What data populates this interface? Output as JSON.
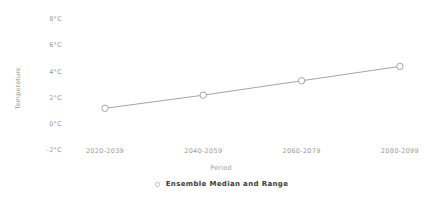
{
  "chart_data": {
    "type": "line",
    "title": "",
    "subtitle": "",
    "xlabel": "Period",
    "ylabel": "Temperature",
    "categories": [
      "2020-2039",
      "2040-2059",
      "2060-2079",
      "2080-2099"
    ],
    "series": [
      {
        "name": "Ensemble Median and Range",
        "values": [
          1.2,
          2.2,
          3.3,
          4.4
        ],
        "marker": "open-circle",
        "color": "#9a9a9a"
      }
    ],
    "y_tick_labels": [
      "8°C",
      "6°C",
      "4°C",
      "2°C",
      "0°C",
      "-2°C"
    ],
    "y_tick_values": [
      8,
      6,
      4,
      2,
      0,
      -2
    ],
    "ylim": [
      -2,
      8
    ],
    "grid": false,
    "legend_position": "bottom",
    "legend": [
      {
        "label": "Ensemble Median and Range",
        "marker": "open-circle"
      }
    ]
  },
  "colors": {
    "line": "#9a9a9a",
    "marker_stroke": "#9a9a9a",
    "marker_fill": "#ffffff",
    "tick_text": "#9a9a9a",
    "legend_text": "#3a3a3a",
    "background": "#ffffff"
  }
}
